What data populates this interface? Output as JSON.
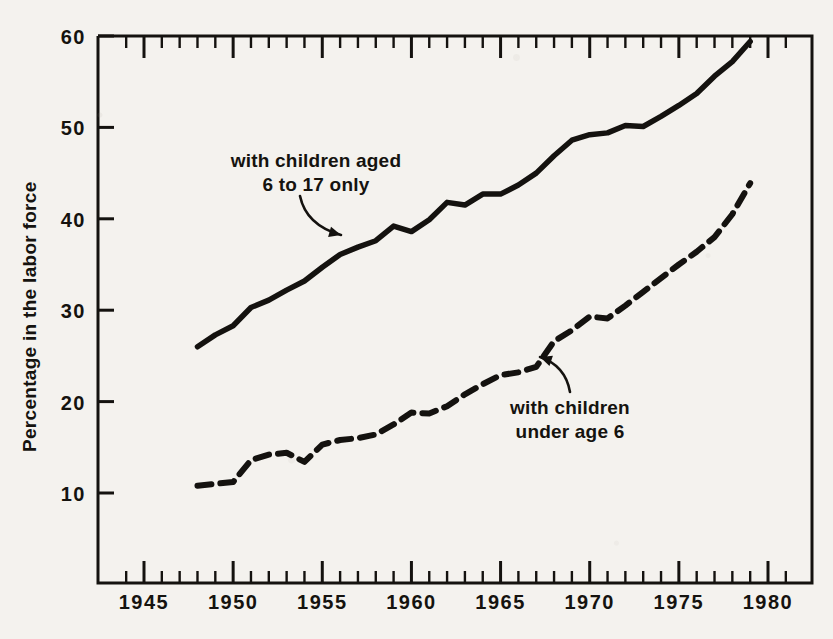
{
  "chart_data": {
    "type": "line",
    "title": "",
    "subtitle": "",
    "xlabel": "",
    "ylabel": "Percentage in the labor force",
    "xlim": [
      1943,
      1981
    ],
    "ylim": [
      8,
      60
    ],
    "grid": false,
    "legend_position": "inline-annotations",
    "x_ticks_major": [
      1945,
      1950,
      1955,
      1960,
      1965,
      1970,
      1975,
      1980
    ],
    "x_tick_labels": [
      "1945",
      "1950",
      "1955",
      "1960",
      "1965",
      "1970",
      "1975",
      "1980"
    ],
    "x_minor_tick_interval": 1,
    "y_ticks": [
      10,
      20,
      30,
      40,
      50,
      60
    ],
    "y_tick_labels": [
      "10",
      "20",
      "30",
      "40",
      "50",
      "60"
    ],
    "annotations": [
      {
        "id": "ann-school-age",
        "line1": "with children aged",
        "line2": "6 to 17 only",
        "text_x": 316,
        "text_y": 167,
        "arrow_from_x": 300,
        "arrow_from_y": 196,
        "arrow_to_x": 341,
        "arrow_to_y": 235
      },
      {
        "id": "ann-preschool",
        "line1": "with children",
        "line2": "under age 6",
        "text_x": 570,
        "text_y": 414,
        "arrow_from_x": 570,
        "arrow_from_y": 392,
        "arrow_to_x": 540,
        "arrow_to_y": 357
      }
    ],
    "series": [
      {
        "name": "with children aged 6 to 17 only",
        "style": "solid",
        "color": "#14120f",
        "x": [
          1948,
          1949,
          1950,
          1951,
          1952,
          1953,
          1954,
          1955,
          1956,
          1957,
          1958,
          1959,
          1960,
          1961,
          1962,
          1963,
          1964,
          1965,
          1966,
          1967,
          1968,
          1969,
          1970,
          1971,
          1972,
          1973,
          1974,
          1975,
          1976,
          1977,
          1978,
          1979
        ],
        "y": [
          26.0,
          27.3,
          28.3,
          30.3,
          31.1,
          32.2,
          33.2,
          34.7,
          36.1,
          36.9,
          37.6,
          39.2,
          38.6,
          39.9,
          41.8,
          41.5,
          42.7,
          42.7,
          43.7,
          45.0,
          46.9,
          48.6,
          49.2,
          49.4,
          50.2,
          50.1,
          51.2,
          52.4,
          53.7,
          55.6,
          57.2,
          59.4
        ],
        "first_point_year": 1948,
        "first_point_value": 26.0,
        "last_point_year": 1979,
        "last_point_value": 59.4
      },
      {
        "name": "with children under age 6",
        "style": "dashed",
        "color": "#14120f",
        "x": [
          1948,
          1949,
          1950,
          1951,
          1952,
          1953,
          1954,
          1955,
          1956,
          1957,
          1958,
          1959,
          1960,
          1961,
          1962,
          1963,
          1964,
          1965,
          1966,
          1967,
          1968,
          1969,
          1970,
          1971,
          1972,
          1973,
          1974,
          1975,
          1976,
          1977,
          1978,
          1979
        ],
        "y": [
          10.8,
          11.0,
          11.2,
          13.6,
          14.2,
          14.4,
          13.4,
          15.3,
          15.8,
          16.0,
          16.4,
          17.5,
          18.8,
          18.7,
          19.5,
          20.8,
          21.9,
          22.9,
          23.2,
          23.8,
          26.6,
          27.8,
          29.3,
          29.1,
          30.5,
          32.0,
          33.5,
          35.0,
          36.4,
          38.0,
          40.5,
          43.9
        ],
        "first_point_year": 1948,
        "first_point_value": 10.8,
        "last_point_year": 1979,
        "last_point_value": 43.9
      }
    ]
  },
  "figure": {
    "y_axis_title": "Percentage in the labor force"
  }
}
